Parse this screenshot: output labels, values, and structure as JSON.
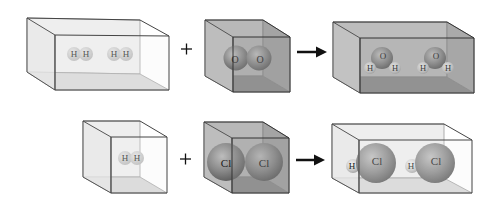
{
  "diagram": {
    "type": "chemical-reaction-particle-diagram",
    "reactions": [
      {
        "id": "water",
        "reactants": [
          {
            "box": "rect",
            "formula": "H2",
            "count": 2,
            "atoms": [
              "H",
              "H"
            ]
          },
          {
            "box": "cube",
            "formula": "O2",
            "count": 1,
            "atoms": [
              "O",
              "O"
            ]
          }
        ],
        "products": [
          {
            "box": "rect",
            "formula": "H2O",
            "count": 2,
            "atoms": [
              "H",
              "O",
              "H"
            ]
          }
        ]
      },
      {
        "id": "hydrogen-chloride",
        "reactants": [
          {
            "box": "cube",
            "formula": "H2",
            "count": 1,
            "atoms": [
              "H",
              "H"
            ]
          },
          {
            "box": "cube",
            "formula": "Cl2",
            "count": 1,
            "atoms": [
              "Cl",
              "Cl"
            ]
          }
        ],
        "products": [
          {
            "box": "rect",
            "formula": "HCl",
            "count": 2,
            "atoms": [
              "H",
              "Cl"
            ]
          }
        ]
      }
    ],
    "symbols": {
      "plus": "+",
      "arrow": "→"
    },
    "labels": {
      "H": "H",
      "O": "O",
      "Cl": "Cl"
    }
  }
}
